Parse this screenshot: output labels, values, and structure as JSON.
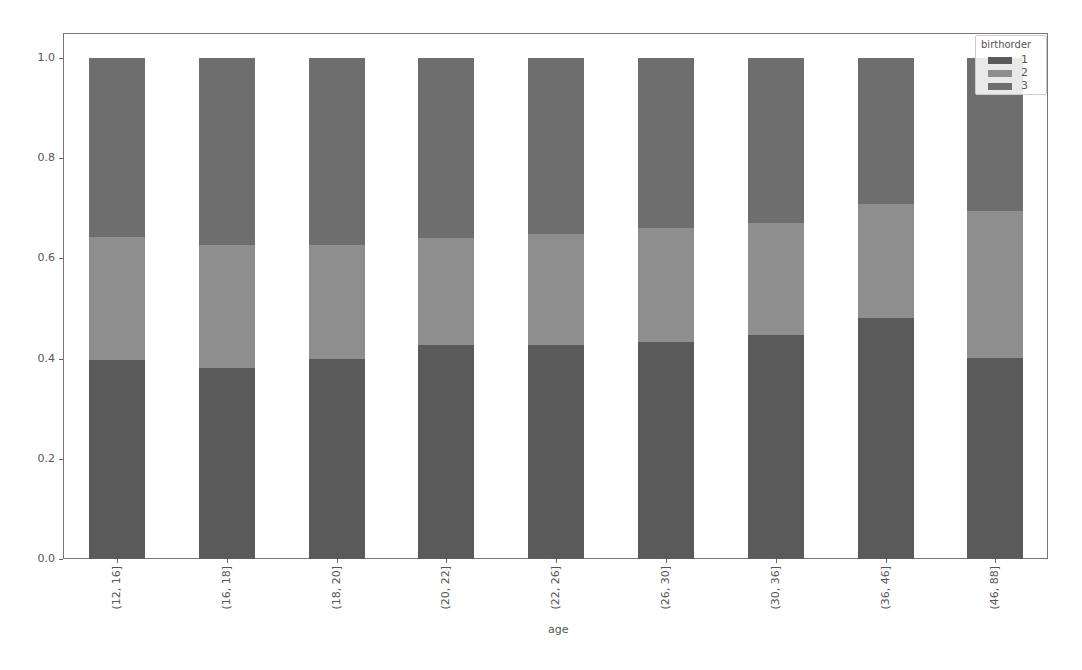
{
  "chart_data": {
    "type": "bar",
    "stacked": true,
    "title": "",
    "xlabel": "age",
    "ylabel": "",
    "ylim": [
      0.0,
      1.05
    ],
    "yticks": [
      "0.0",
      "0.2",
      "0.4",
      "0.6",
      "0.8",
      "1.0"
    ],
    "categories": [
      "(12, 16]",
      "(16, 18]",
      "(18, 20]",
      "(20, 22]",
      "(22, 26]",
      "(26, 30]",
      "(30, 36]",
      "(36, 46]",
      "(46, 88]"
    ],
    "legend": {
      "title": "birthorder",
      "position": "upper right",
      "entries": [
        "1",
        "2",
        "3"
      ]
    },
    "grid": false,
    "series": [
      {
        "name": "1",
        "color": "#5a5a5a",
        "values": [
          0.397,
          0.381,
          0.399,
          0.427,
          0.427,
          0.433,
          0.447,
          0.482,
          0.401
        ]
      },
      {
        "name": "2",
        "color": "#8e8e8e",
        "values": [
          0.246,
          0.246,
          0.228,
          0.214,
          0.222,
          0.228,
          0.224,
          0.227,
          0.294
        ]
      },
      {
        "name": "3",
        "color": "#6e6e6e",
        "values": [
          0.357,
          0.373,
          0.373,
          0.359,
          0.351,
          0.339,
          0.329,
          0.291,
          0.305
        ]
      }
    ]
  },
  "caption": "Figure 4.x  Share of birth order by age group"
}
